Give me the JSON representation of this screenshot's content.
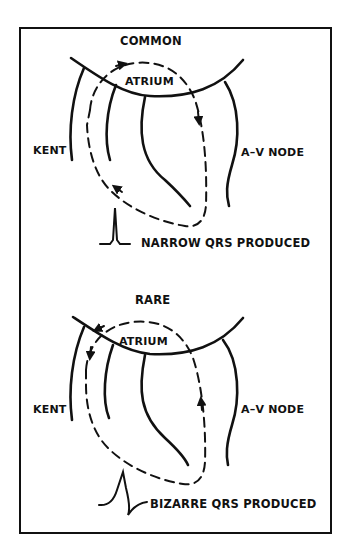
{
  "figure": {
    "colors": {
      "ink": "#111111",
      "background": "#ffffff"
    },
    "panels": [
      {
        "id": "common",
        "title": "COMMON",
        "chamber_label": "ATRIUM",
        "left_pathway_label": "KENT",
        "right_pathway_label": "A–V NODE",
        "qrs_label": "NARROW QRS PRODUCED",
        "qrs_shape": "narrow-spike-icon",
        "circuit_direction": "anterograde via A-V node, retrograde via Kent"
      },
      {
        "id": "rare",
        "title": "RARE",
        "chamber_label": "ATRIUM",
        "left_pathway_label": "KENT",
        "right_pathway_label": "A–V NODE",
        "qrs_label": "BIZARRE QRS PRODUCED",
        "qrs_shape": "wide-bizarre-complex-icon",
        "circuit_direction": "anterograde via Kent, retrograde via A-V node"
      }
    ]
  }
}
